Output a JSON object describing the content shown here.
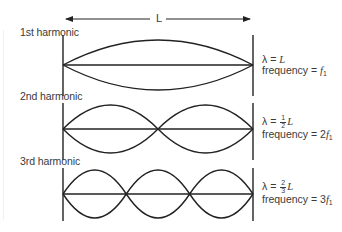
{
  "diagram": {
    "length_label": "L",
    "stroke_color": "#222222",
    "text_color": "#3a3a3a",
    "harmonics": [
      {
        "name": "1st harmonic",
        "loops": 1,
        "wavelength_prefix": "λ = ",
        "wavelength_fraction": null,
        "wavelength_var": "L",
        "frequency_prefix": "frequency = ",
        "frequency_coef": "",
        "frequency_var": "f",
        "frequency_sub": "1"
      },
      {
        "name": "2nd harmonic",
        "loops": 2,
        "wavelength_prefix": "λ = ",
        "wavelength_fraction": {
          "num": "1",
          "den": "2"
        },
        "wavelength_var": "L",
        "frequency_prefix": "frequency = ",
        "frequency_coef": "2",
        "frequency_var": "f",
        "frequency_sub": "1"
      },
      {
        "name": "3rd harmonic",
        "loops": 3,
        "wavelength_prefix": "λ = ",
        "wavelength_fraction": {
          "num": "2",
          "den": "3"
        },
        "wavelength_var": "L",
        "frequency_prefix": "frequency = ",
        "frequency_coef": "3",
        "frequency_var": "f",
        "frequency_sub": "1"
      }
    ]
  }
}
